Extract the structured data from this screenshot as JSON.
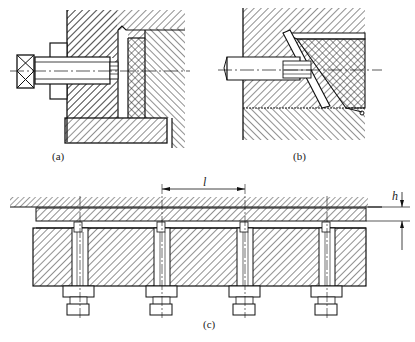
{
  "figure": {
    "panels": [
      {
        "id": "a",
        "caption": "(a)",
        "description": "Side-mounted adjusting screw with square head pressing against a wedge/insert in hatched body"
      },
      {
        "id": "b",
        "caption": "(b)",
        "description": "Inclined wedge channel with screw acting at an angle in hatched body"
      },
      {
        "id": "c",
        "caption": "(c)",
        "description": "Row of four jacking bolts with nuts under a plate, spacing l and gap h"
      }
    ],
    "dimensions": {
      "spacing_label": "l",
      "gap_label": "h"
    },
    "colors": {
      "line": "#1a1a1a",
      "background": "#ffffff"
    }
  }
}
